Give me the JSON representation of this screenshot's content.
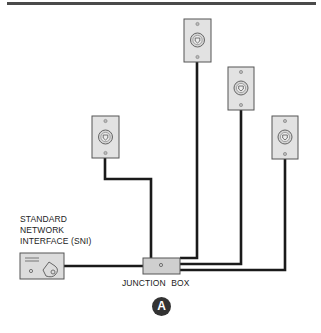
{
  "diagram": {
    "type": "telephone wiring diagram",
    "labels": {
      "sni": [
        "STANDARD",
        "NETWORK",
        "INTERFACE  (SNI)"
      ],
      "junction_box": "JUNCTION BOX",
      "callout": "A"
    },
    "components": [
      {
        "id": "sni",
        "name": "Standard Network Interface (SNI)",
        "kind": "interface-box"
      },
      {
        "id": "junction_box",
        "name": "Junction Box",
        "kind": "junction-box"
      },
      {
        "id": "jack_1",
        "name": "Wall jack 1",
        "kind": "wall-jack"
      },
      {
        "id": "jack_2",
        "name": "Wall jack 2",
        "kind": "wall-jack"
      },
      {
        "id": "jack_3",
        "name": "Wall jack 3",
        "kind": "wall-jack"
      },
      {
        "id": "jack_4",
        "name": "Wall jack 4",
        "kind": "wall-jack"
      }
    ],
    "connections": [
      {
        "from": "sni",
        "to": "junction_box"
      },
      {
        "from": "junction_box",
        "to": "jack_1"
      },
      {
        "from": "junction_box",
        "to": "jack_2"
      },
      {
        "from": "junction_box",
        "to": "jack_3"
      },
      {
        "from": "junction_box",
        "to": "jack_4"
      }
    ],
    "topology": "star (home-run) from junction box",
    "colors": {
      "wire": "#1a1a1a",
      "plate_fill": "#e2e2e2",
      "plate_stroke": "#555555",
      "box_fill": "#cfcfcf",
      "callout_bg": "#333333",
      "rule": "#4a4a4a"
    }
  }
}
